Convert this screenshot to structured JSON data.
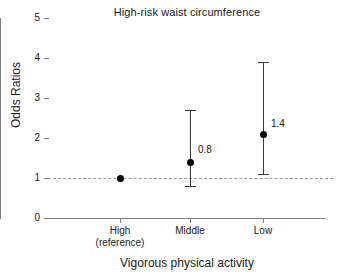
{
  "chart_data": {
    "type": "scatter",
    "title": "High-risk waist circumference",
    "xlabel": "Vigorous physical activity",
    "ylabel": "Odds Ratios",
    "ylim": [
      0,
      5
    ],
    "yticks": [
      0,
      1,
      2,
      3,
      4,
      5
    ],
    "ytick_labels": [
      "0",
      "1",
      "2",
      "3",
      "4",
      "5"
    ],
    "grid": false,
    "legend": "none",
    "categories": [
      "High\n(reference)",
      "Middle",
      "Low"
    ],
    "category_labels": [
      {
        "line1": "High",
        "line2": "(reference)"
      },
      {
        "line1": "Middle",
        "line2": ""
      },
      {
        "line1": "Low",
        "line2": ""
      }
    ],
    "series": [
      {
        "name": "Odds Ratio",
        "values": [
          1.0,
          1.4,
          2.1
        ],
        "ci_lower": [
          1.0,
          0.8,
          1.1
        ],
        "ci_upper": [
          1.0,
          2.7,
          3.9
        ],
        "point_labels": [
          "",
          "0.8",
          "1.4"
        ]
      }
    ],
    "annotations": [
      {
        "text": "0.8",
        "x_category": "Middle",
        "y": 1.7
      },
      {
        "text": "1.4",
        "x_category": "Low",
        "y": 2.35
      }
    ],
    "reference_line": {
      "y": 1.0,
      "style": "dashed",
      "color": "#9a9a9a"
    },
    "colors": {
      "marker": "#000000",
      "errorbar": "#3a3a3a",
      "axis": "#808080",
      "text": "#1a1a1a",
      "background": "#ffffff"
    }
  }
}
